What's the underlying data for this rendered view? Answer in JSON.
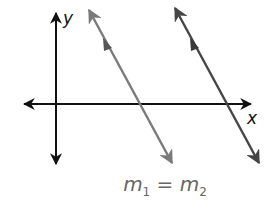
{
  "diagram": {
    "axes": {
      "x_label": "x",
      "y_label": "y"
    },
    "lines": [
      {
        "name": "line-1",
        "color": "#7a7a7a",
        "from": [
          88,
          8
        ],
        "to": [
          173,
          165
        ],
        "marker": "parallel-tick"
      },
      {
        "name": "line-2",
        "color": "#454545",
        "from": [
          174,
          6
        ],
        "to": [
          260,
          165
        ],
        "marker": "parallel-tick"
      }
    ],
    "caption": {
      "m1_var": "m",
      "m1_sub": "1",
      "eq": " = ",
      "m2_var": "m",
      "m2_sub": "2"
    }
  }
}
